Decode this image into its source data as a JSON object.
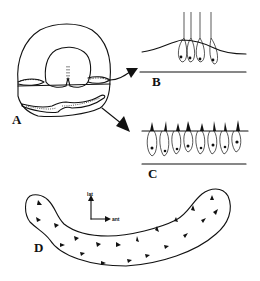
{
  "figure": {
    "panels": [
      {
        "id": "A",
        "label": "A",
        "description": "Cross-section of otic structure with two sensory regions indicated by arrows"
      },
      {
        "id": "B",
        "label": "B",
        "description": "Sensory epithelium with hair cells bearing long kinocilia on a mound"
      },
      {
        "id": "C",
        "label": "C",
        "description": "Row of hair cells with short stereocilia bundles on flat epithelium"
      },
      {
        "id": "D",
        "label": "D",
        "description": "Curved sensory patch with arrowheads indicating hair cell polarity"
      }
    ],
    "axes": {
      "vertical_label": "lat",
      "horizontal_label": "ant"
    },
    "colors": {
      "ink": "#111111",
      "background": "#ffffff"
    }
  }
}
